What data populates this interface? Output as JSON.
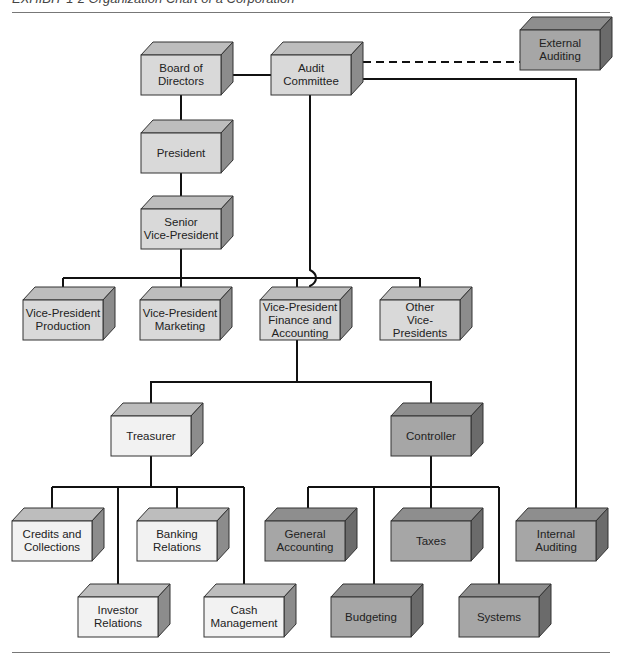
{
  "title": "EXHIBIT 1-2 Organization Chart of a Corporation",
  "colors": {
    "light": {
      "front": "#d9d9d9",
      "top": "#bdbdbd",
      "side": "#8c8c8c"
    },
    "white": {
      "front": "#f2f2f2",
      "top": "#bdbdbd",
      "side": "#8c8c8c"
    },
    "dark": {
      "front": "#a6a6a6",
      "top": "#8e8e8e",
      "side": "#6b6b6b"
    },
    "line": "#111111"
  },
  "nodes": [
    {
      "id": "board",
      "label": "Board of\nDirectors",
      "tone": "light",
      "x": 141,
      "y": 55
    },
    {
      "id": "audit",
      "label": "Audit\nCommittee",
      "tone": "light",
      "x": 271,
      "y": 55
    },
    {
      "id": "external",
      "label": "External\nAuditing",
      "tone": "dark",
      "x": 520,
      "y": 30
    },
    {
      "id": "president",
      "label": "President",
      "tone": "light",
      "x": 141,
      "y": 133
    },
    {
      "id": "svp",
      "label": "Senior\nVice-President",
      "tone": "light",
      "x": 141,
      "y": 209
    },
    {
      "id": "vp-production",
      "label": "Vice-President\nProduction",
      "tone": "light",
      "x": 23,
      "y": 300
    },
    {
      "id": "vp-marketing",
      "label": "Vice-President\nMarketing",
      "tone": "light",
      "x": 140,
      "y": 300
    },
    {
      "id": "vp-finance",
      "label": "Vice-President\nFinance and\nAccounting",
      "tone": "light",
      "x": 260,
      "y": 300
    },
    {
      "id": "vp-other",
      "label": "Other\nVice-Presidents",
      "tone": "light",
      "x": 380,
      "y": 300
    },
    {
      "id": "treasurer",
      "label": "Treasurer",
      "tone": "white",
      "x": 111,
      "y": 416
    },
    {
      "id": "controller",
      "label": "Controller",
      "tone": "dark",
      "x": 391,
      "y": 416
    },
    {
      "id": "credits",
      "label": "Credits and\nCollections",
      "tone": "white",
      "x": 12,
      "y": 521
    },
    {
      "id": "banking",
      "label": "Banking\nRelations",
      "tone": "white",
      "x": 137,
      "y": 521
    },
    {
      "id": "investor",
      "label": "Investor\nRelations",
      "tone": "white",
      "x": 78,
      "y": 597
    },
    {
      "id": "cash",
      "label": "Cash\nManagement",
      "tone": "white",
      "x": 204,
      "y": 597
    },
    {
      "id": "general-accounting",
      "label": "General\nAccounting",
      "tone": "dark",
      "x": 265,
      "y": 521
    },
    {
      "id": "taxes",
      "label": "Taxes",
      "tone": "dark",
      "x": 391,
      "y": 521
    },
    {
      "id": "budgeting",
      "label": "Budgeting",
      "tone": "dark",
      "x": 331,
      "y": 597
    },
    {
      "id": "systems",
      "label": "Systems",
      "tone": "dark",
      "x": 459,
      "y": 597
    },
    {
      "id": "internal",
      "label": "Internal\nAuditing",
      "tone": "dark",
      "x": 516,
      "y": 521
    }
  ],
  "box": {
    "w": 80,
    "h": 40,
    "dx": 12,
    "dy": 13
  },
  "edges": [
    {
      "from": "board",
      "to": "audit",
      "style": "solid"
    },
    {
      "from": "audit",
      "to": "external",
      "style": "dashed"
    },
    {
      "from": "board",
      "to": "president",
      "style": "solid"
    },
    {
      "from": "president",
      "to": "svp",
      "style": "solid"
    },
    {
      "from": "svp",
      "to": [
        "vp-production",
        "vp-marketing",
        "vp-finance",
        "vp-other"
      ],
      "style": "solid"
    },
    {
      "from": "audit",
      "to": "vp-finance",
      "style": "solid",
      "note": "hops over VP bus"
    },
    {
      "from": "audit",
      "to": "internal",
      "style": "solid"
    },
    {
      "from": "vp-finance",
      "to": [
        "treasurer",
        "controller"
      ],
      "style": "solid"
    },
    {
      "from": "treasurer",
      "to": [
        "credits",
        "banking",
        "investor",
        "cash"
      ],
      "style": "solid"
    },
    {
      "from": "controller",
      "to": [
        "general-accounting",
        "taxes",
        "budgeting",
        "systems"
      ],
      "style": "solid"
    }
  ]
}
